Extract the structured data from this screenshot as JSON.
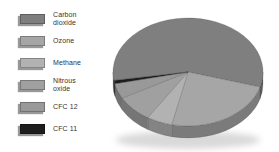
{
  "page": {
    "background_color": "#ffffff"
  },
  "chart_data": {
    "type": "pie",
    "style": "3d",
    "title": "",
    "categories": [
      "Carbon dioxide",
      "Ozone",
      "Methane",
      "Nitrous oxide",
      "CFC 12",
      "CFC 11"
    ],
    "values": [
      57,
      24,
      5.5,
      8,
      4.5,
      1
    ],
    "unit": "percent",
    "colors": [
      "#7f7f7f",
      "#a6a6a6",
      "#b2b2b2",
      "#a0a0a0",
      "#999999",
      "#1e1e1e"
    ],
    "start_angle_deg": 171,
    "direction": "clockwise",
    "legend_position": "left",
    "grid": false
  }
}
